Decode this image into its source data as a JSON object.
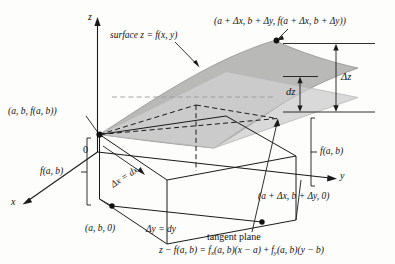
{
  "figure": {
    "background_color": "#fdfdfc",
    "ink_color": "#111111"
  },
  "axes": {
    "z_label": "z",
    "x_label": "x",
    "y_label": "y",
    "origin_label": "0"
  },
  "labels": {
    "surface": "surface z = f(x, y)",
    "point_near": "(a, b, f(a, b))",
    "point_far": "(a + Δx, b + Δy, f(a + Δx, b + Δy))",
    "base_point_near": "(a, b, 0)",
    "base_point_far": "(a + Δx, b + Δy, 0)",
    "delta_z": "Δz",
    "dz": "dz",
    "height_left": "f(a, b)",
    "height_right": "f(a, b)",
    "delta_x": "Δx = dx",
    "delta_y": "Δy = dy",
    "tangent_plane": "tangent plane"
  },
  "equation": {
    "lhs": "z − f(a, b) =",
    "term1_fn": "f",
    "term1_sub": "x",
    "term1_rest": "(a, b)(x − a)",
    "plus": "+",
    "term2_fn": "f",
    "term2_sub": "y",
    "term2_rest": "(a, b)(y − b)",
    "full": "z − f(a, b) = fₓ(a, b)(x − a) + fᵧ(a, b)(y − b)"
  },
  "geometry": {
    "surface_fill": "#9b9b9b",
    "tangent_plane_fill": "#c9c9c9",
    "box_stroke": "#1a1a1a",
    "dashed_stroke": "#1a1a1a"
  }
}
